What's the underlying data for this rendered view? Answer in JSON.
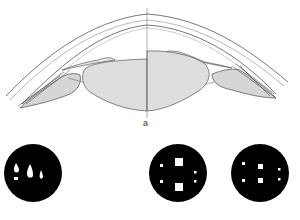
{
  "figure": {
    "panel_label": "a",
    "colors": {
      "line": "#555555",
      "fill": "#dedede",
      "disc": "#000000",
      "spot": "#ffffff"
    },
    "discs": [
      {
        "name": "disc-1",
        "pattern": "three droplet-shaped light spots of decreasing size with small mark below first"
      },
      {
        "name": "disc-2",
        "pattern": "two large squares vertically aligned, four small dots at sides"
      },
      {
        "name": "disc-3",
        "pattern": "two small squares vertically aligned, four small dots at sides"
      }
    ]
  }
}
